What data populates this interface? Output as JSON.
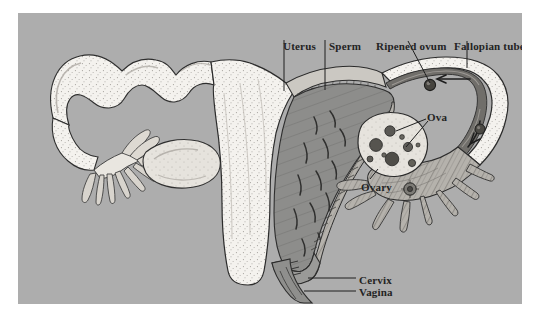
{
  "figure": {
    "panel": {
      "background_color": "#adadad",
      "border_color": "#ffffff"
    },
    "labels": [
      {
        "id": "uterus",
        "text": "Uterus"
      },
      {
        "id": "sperm",
        "text": "Sperm"
      },
      {
        "id": "ripened",
        "text": "Ripened ovum"
      },
      {
        "id": "fallopian",
        "text": "Fallopian tube"
      },
      {
        "id": "ova",
        "text": "Ova"
      },
      {
        "id": "ovary",
        "text": "Ovary"
      },
      {
        "id": "cervix",
        "text": "Cervix"
      },
      {
        "id": "vagina",
        "text": "Vagina"
      }
    ],
    "colors": {
      "background": "#adadad",
      "tissue_light": "#f2f0eb",
      "tissue_mid": "#c8c5bf",
      "cavity_dark": "#8b8b8b",
      "tube_channel": "#6f6d69",
      "outline": "#2b2b2b",
      "label_text": "#232323",
      "ovum_fill": "#4a4845"
    },
    "structures": [
      "left fallopian tube",
      "left fimbriae",
      "left ovary",
      "uterus body",
      "uterine cavity",
      "endometrium",
      "cervix",
      "vagina",
      "right fallopian tube",
      "right fimbriae",
      "right ovary",
      "ova follicles",
      "released ovum",
      "sperm"
    ]
  }
}
